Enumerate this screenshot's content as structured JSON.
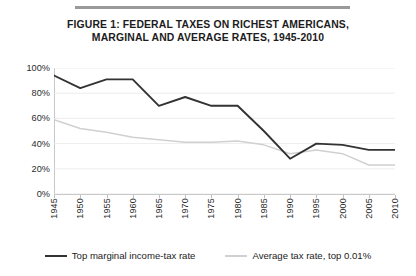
{
  "figure": {
    "title_line1": "FIGURE 1: FEDERAL TAXES ON RICHEST AMERICANS,",
    "title_line2": "MARGINAL AND AVERAGE RATES, 1945-2010"
  },
  "chart_data": {
    "type": "line",
    "title": "FIGURE 1: FEDERAL TAXES ON RICHEST AMERICANS, MARGINAL AND AVERAGE RATES, 1945-2010",
    "xlabel": "",
    "ylabel": "",
    "x": [
      1945,
      1950,
      1955,
      1960,
      1965,
      1970,
      1975,
      1980,
      1985,
      1990,
      1995,
      2000,
      2005,
      2010
    ],
    "xticklabels": [
      "1945",
      "1950",
      "1955",
      "1960",
      "1965",
      "1970",
      "1975",
      "1980",
      "1985",
      "1990",
      "1995",
      "2000",
      "2005",
      "2010"
    ],
    "yticklabels": [
      "100%",
      "80%",
      "60%",
      "40%",
      "20%",
      "0%"
    ],
    "yticks": [
      100,
      80,
      60,
      40,
      20,
      0
    ],
    "ylim": [
      0,
      100
    ],
    "xlim": [
      1945,
      2010
    ],
    "grid": true,
    "legend_position": "bottom",
    "series": [
      {
        "name": "Top marginal income-tax rate",
        "color": "#333333",
        "values": [
          94,
          84,
          91,
          91,
          70,
          77,
          70,
          70,
          50,
          28,
          40,
          39,
          35,
          35
        ]
      },
      {
        "name": "Average tax rate, top 0.01%",
        "color": "#d0d0d0",
        "values": [
          59,
          52,
          49,
          45,
          43,
          41,
          41,
          42,
          39,
          32,
          35,
          32,
          23,
          23
        ]
      }
    ]
  },
  "legend": {
    "items": [
      {
        "label": "Top marginal income-tax rate",
        "color": "#333333"
      },
      {
        "label": "Average tax rate, top 0.01%",
        "color": "#d0d0d0"
      }
    ]
  },
  "colors": {
    "marginal": "#333333",
    "average": "#d0d0d0",
    "gridline": "#e8e8e8",
    "axis": "#c8c8c8",
    "rule": "#9a9a9a"
  }
}
